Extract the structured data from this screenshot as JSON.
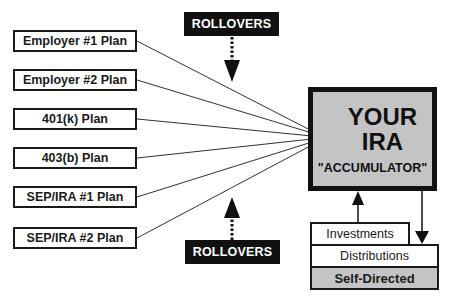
{
  "diagram": {
    "plans": [
      {
        "label": "Employer #1 Plan"
      },
      {
        "label": "Employer #2 Plan"
      },
      {
        "label": "401(k) Plan"
      },
      {
        "label": "403(b) Plan"
      },
      {
        "label": "SEP/IRA #1 Plan"
      },
      {
        "label": "SEP/IRA #2 Plan"
      }
    ],
    "rollovers_top": {
      "label": "ROLLOVERS"
    },
    "rollovers_bottom": {
      "label": "ROLLOVERS"
    },
    "ira": {
      "line1": "YOUR",
      "line2": "IRA",
      "line3": "\"ACCUMULATOR\""
    },
    "sub_boxes": {
      "investments": "Investments",
      "distributions": "Distributions",
      "self_directed": "Self-Directed"
    },
    "colors": {
      "ink": "#111111",
      "fill_gray": "#d4d4d4",
      "background": "#ffffff"
    }
  }
}
